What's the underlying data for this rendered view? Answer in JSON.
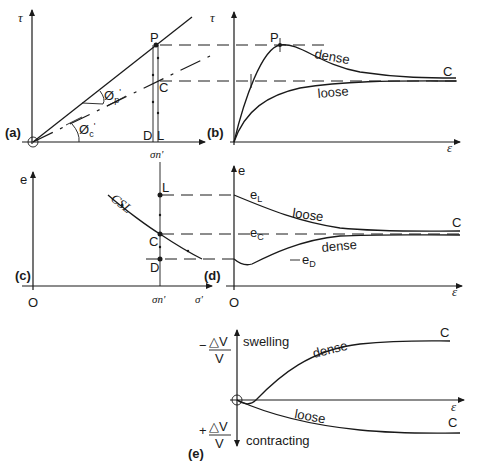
{
  "panels": {
    "a": {
      "label": "(a)",
      "y_axis": "τ",
      "x_tick": "σn'",
      "x_tick_base": "σ",
      "x_tick_sub": "n",
      "x_tick_prime": "'",
      "points": {
        "P": "P",
        "C": "C",
        "D": "D",
        "L": "L"
      },
      "angle_peak": "Ø",
      "angle_peak_sub": "p",
      "angle_crit": "Ø",
      "angle_crit_sub": "c",
      "prime": "'"
    },
    "b": {
      "label": "(b)",
      "y_axis": "τ",
      "x_axis": "ε",
      "peak_label": "P",
      "end_label": "C",
      "curve_dense": "dense",
      "curve_loose": "loose"
    },
    "c": {
      "label": "(c)",
      "y_axis": "e",
      "x_axis": "σ'",
      "origin": "O",
      "x_tick": "σn'",
      "csl_label": "CSL",
      "points": {
        "L": "L",
        "C": "C",
        "D": "D"
      }
    },
    "d": {
      "label": "(d)",
      "y_axis": "e",
      "x_axis": "ε",
      "origin": "O",
      "end_label": "C",
      "curve_loose": "loose",
      "curve_dense": "dense",
      "e_L": "e",
      "e_L_sub": "L",
      "e_C": "e",
      "e_C_sub": "C",
      "e_D": "e",
      "e_D_sub": "D"
    },
    "e": {
      "label": "(e)",
      "x_axis": "ε",
      "upper_sign": "−",
      "lower_sign": "+",
      "dv": "△V",
      "v": "V",
      "upper_text": "swelling",
      "lower_text": "contracting",
      "curve_dense": "dense",
      "curve_loose": "loose",
      "end_label_dense": "C",
      "end_label_loose": "C"
    }
  }
}
